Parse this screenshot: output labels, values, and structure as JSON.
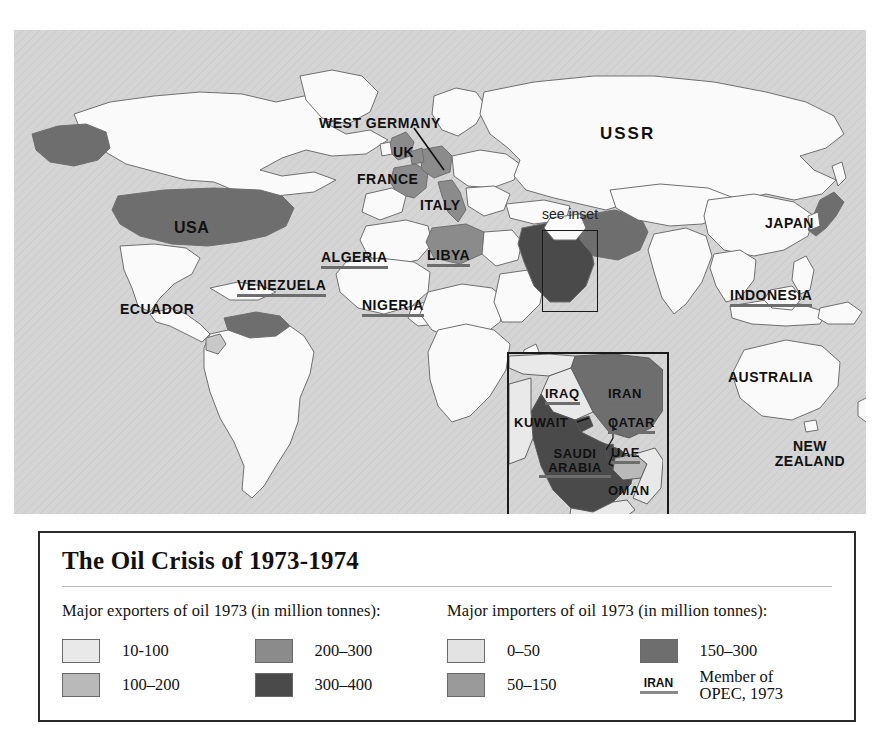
{
  "legend": {
    "title": "The Oil Crisis of 1973-1974",
    "exporters": {
      "heading": "Major exporters of oil 1973 (in million tonnes):",
      "items": [
        {
          "label": "10-100",
          "color": "#e9e9e9"
        },
        {
          "label": "100–200",
          "color": "#b9b9b9"
        },
        {
          "label": "200–300",
          "color": "#8b8b8b"
        },
        {
          "label": "300–400",
          "color": "#4a4a4a"
        }
      ]
    },
    "importers": {
      "heading": "Major importers of oil 1973 (in million tonnes):",
      "items": [
        {
          "label": "0–50",
          "color": "#e3e3e3"
        },
        {
          "label": "50–150",
          "color": "#9a9a9a"
        },
        {
          "label": "150–300",
          "color": "#6e6e6e"
        }
      ]
    },
    "opec": {
      "sample": "IRAN",
      "line1": "Member of",
      "line2": "OPEC, 1973"
    }
  },
  "map": {
    "labels": [
      {
        "text": "USA",
        "opec": false
      },
      {
        "text": "VENEZUELA",
        "opec": true
      },
      {
        "text": "ECUADOR",
        "opec": false
      },
      {
        "text": "WEST GERMANY",
        "opec": false
      },
      {
        "text": "UK",
        "opec": false
      },
      {
        "text": "FRANCE",
        "opec": false
      },
      {
        "text": "ITALY",
        "opec": false
      },
      {
        "text": "ALGERIA",
        "opec": true
      },
      {
        "text": "LIBYA",
        "opec": true
      },
      {
        "text": "NIGERIA",
        "opec": true
      },
      {
        "text": "see inset",
        "opec": false
      },
      {
        "text": "USSR",
        "opec": false
      },
      {
        "text": "JAPAN",
        "opec": false
      },
      {
        "text": "INDONESIA",
        "opec": true
      },
      {
        "text": "AUSTRALIA",
        "opec": false
      },
      {
        "text": "NEW",
        "opec": false
      },
      {
        "text": "ZEALAND",
        "opec": false
      }
    ]
  },
  "inset": {
    "labels": [
      {
        "text": "IRAQ",
        "opec": true
      },
      {
        "text": "IRAN",
        "opec": true
      },
      {
        "text": "KUWAIT",
        "opec": false
      },
      {
        "text": "QATAR",
        "opec": true
      },
      {
        "text": "UAE",
        "opec": true
      },
      {
        "text": "SAUDI",
        "opec": true
      },
      {
        "text": "ARABIA",
        "opec": true
      },
      {
        "text": "OMAN",
        "opec": false
      }
    ]
  }
}
